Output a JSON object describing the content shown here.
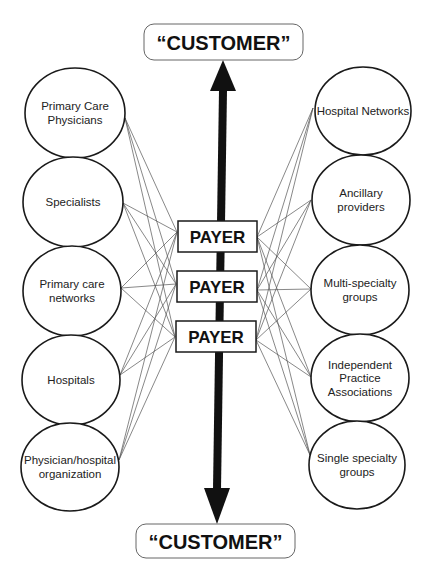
{
  "diagram": {
    "customer_top": {
      "label": "“CUSTOMER”",
      "x": 144,
      "y": 24,
      "w": 159,
      "h": 36
    },
    "customer_bottom": {
      "label": "“CUSTOMER”",
      "x": 136,
      "y": 524,
      "w": 159,
      "h": 34
    },
    "payers": [
      {
        "label": "PAYER",
        "x": 178,
        "y": 221,
        "w": 79,
        "h": 31
      },
      {
        "label": "PAYER",
        "x": 177,
        "y": 271,
        "w": 80,
        "h": 31
      },
      {
        "label": "PAYER",
        "x": 176,
        "y": 321,
        "w": 80,
        "h": 31
      }
    ],
    "left_nodes": [
      {
        "lines": [
          "Primary Care",
          "Physicians"
        ],
        "cx": 75,
        "cy": 113,
        "rx": 50,
        "ry": 45
      },
      {
        "lines": [
          "Specialists"
        ],
        "cx": 73,
        "cy": 202,
        "rx": 50,
        "ry": 45
      },
      {
        "lines": [
          "Primary care",
          "networks"
        ],
        "cx": 72,
        "cy": 291,
        "rx": 49,
        "ry": 45
      },
      {
        "lines": [
          "Hospitals"
        ],
        "cx": 71,
        "cy": 380,
        "rx": 49,
        "ry": 45
      },
      {
        "lines": [
          "Physician/hospital",
          "organization"
        ],
        "cx": 70,
        "cy": 467,
        "rx": 49,
        "ry": 44
      }
    ],
    "right_nodes": [
      {
        "lines": [
          "Hospital Networks"
        ],
        "cx": 363,
        "cy": 111,
        "rx": 48,
        "ry": 44
      },
      {
        "lines": [
          "Ancillary",
          "providers"
        ],
        "cx": 361,
        "cy": 200,
        "rx": 49,
        "ry": 45
      },
      {
        "lines": [
          "Multi-specialty",
          "groups"
        ],
        "cx": 360,
        "cy": 290,
        "rx": 49,
        "ry": 45
      },
      {
        "lines": [
          "Independent",
          "Practice",
          "Associations"
        ],
        "cx": 360,
        "cy": 378,
        "rx": 49,
        "ry": 44
      },
      {
        "lines": [
          "Single specialty",
          "groups"
        ],
        "cx": 357,
        "cy": 465,
        "rx": 48,
        "ry": 44
      }
    ],
    "left_anchors": [
      [
        125,
        118
      ],
      [
        123,
        203
      ],
      [
        121,
        288
      ],
      [
        120,
        375
      ],
      [
        119,
        460
      ]
    ],
    "right_anchors": [
      [
        313,
        108
      ],
      [
        311,
        200
      ],
      [
        311,
        289
      ],
      [
        311,
        377
      ],
      [
        310,
        455
      ]
    ],
    "payer_left_anchors": [
      [
        177,
        232
      ],
      [
        176,
        284
      ],
      [
        175,
        337
      ]
    ],
    "payer_right_anchors": [
      [
        257,
        237
      ],
      [
        257,
        290
      ],
      [
        256,
        340
      ]
    ],
    "arrow": {
      "color": "#111111",
      "top_tip": [
        223,
        60
      ],
      "top_head_base_y": 91,
      "top_head_half_width": 13,
      "bottom_tip": [
        217,
        524
      ],
      "bottom_head_base_y": 488,
      "bottom_head_half_width": 13,
      "shaft_width": 8
    },
    "colors": {
      "stroke": "#1a1a1a",
      "connector": "#555555",
      "background": "#ffffff"
    }
  }
}
